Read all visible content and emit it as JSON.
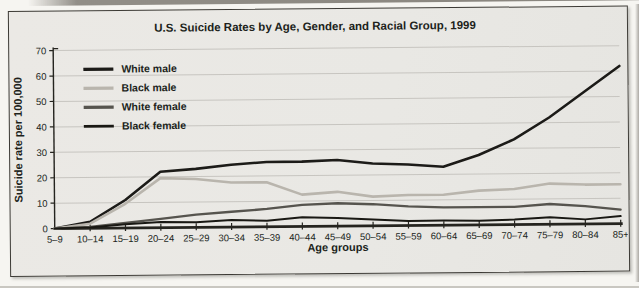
{
  "figure": {
    "title": "U.S. Suicide Rates by Age, Gender, and Racial Group, 1999"
  },
  "chart_data": {
    "type": "line",
    "title": "U.S. Suicide Rates by Age, Gender, and Racial Group, 1999",
    "xlabel": "Age groups",
    "ylabel": "Suicide rate per 100,000",
    "ylim": [
      0,
      70
    ],
    "yticks": [
      0,
      10,
      20,
      30,
      40,
      50,
      60,
      70
    ],
    "grid": true,
    "legend_position": "top-left",
    "categories": [
      "5–9",
      "10–14",
      "15–19",
      "20–24",
      "25–29",
      "30–34",
      "35–39",
      "40–44",
      "45–49",
      "50–54",
      "55–59",
      "60–64",
      "65–69",
      "70–74",
      "75–79",
      "80–84",
      "85+"
    ],
    "series": [
      {
        "name": "White male",
        "color": "#1c1b18",
        "width": 2.6,
        "values": [
          0,
          2.5,
          11,
          22,
          23,
          24.5,
          25.5,
          25.5,
          26,
          24.5,
          24,
          23,
          27.5,
          33.5,
          42,
          52,
          62
        ]
      },
      {
        "name": "Black male",
        "color": "#b9b5ad",
        "width": 2.6,
        "values": [
          0,
          1.8,
          9.5,
          19.5,
          19,
          17.5,
          17.5,
          12.5,
          13.5,
          11.5,
          12,
          12,
          13.5,
          14,
          16,
          15.5,
          15.5
        ]
      },
      {
        "name": "White female",
        "color": "#56544e",
        "width": 2.3,
        "values": [
          0,
          0.5,
          2,
          3.5,
          5,
          6,
          7,
          8.5,
          9,
          8.5,
          7.5,
          7,
          7,
          7,
          8,
          7,
          5.5
        ]
      },
      {
        "name": "Black female",
        "color": "#191813",
        "width": 2.0,
        "values": [
          0,
          0.3,
          1.5,
          2.2,
          2,
          2.8,
          2.4,
          3.6,
          3.2,
          2.5,
          1.8,
          1.8,
          1.6,
          2,
          2.8,
          1.8,
          3
        ]
      }
    ],
    "axis_color": "#25241f",
    "grid_color": "#c7c5c0"
  }
}
